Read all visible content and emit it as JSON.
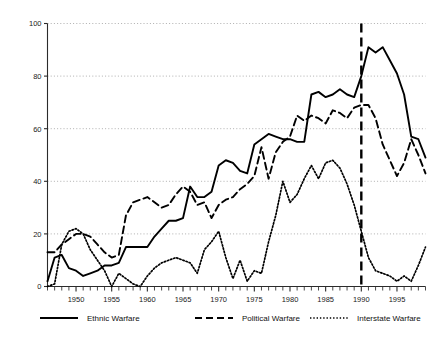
{
  "chart_data": {
    "type": "line",
    "title": "",
    "subtitle": "",
    "xlabel": "",
    "ylabel": "",
    "xlim": [
      1946,
      1999
    ],
    "ylim": [
      0,
      100
    ],
    "grid": true,
    "grid_axis": "y",
    "legend_position": "bottom",
    "x_tick_labels": [
      "1950",
      "1955",
      "1960",
      "1965",
      "1970",
      "1975",
      "1980",
      "1985",
      "1990",
      "1995"
    ],
    "x_tick_values": [
      1950,
      1955,
      1960,
      1965,
      1970,
      1975,
      1980,
      1985,
      1990,
      1995
    ],
    "x_minor_tick_step": 1,
    "y_tick_labels": [
      "0",
      "20",
      "40",
      "60",
      "80",
      "100"
    ],
    "y_tick_values": [
      0,
      20,
      40,
      60,
      80,
      100
    ],
    "annotations": [
      {
        "name": "year-1990-reference-line",
        "type": "vline",
        "x": 1990,
        "style": "dashed",
        "color": "#000000"
      }
    ],
    "x": [
      1946,
      1947,
      1948,
      1949,
      1950,
      1951,
      1952,
      1953,
      1954,
      1955,
      1956,
      1957,
      1958,
      1959,
      1960,
      1961,
      1962,
      1963,
      1964,
      1965,
      1966,
      1967,
      1968,
      1969,
      1970,
      1971,
      1972,
      1973,
      1974,
      1975,
      1976,
      1977,
      1978,
      1979,
      1980,
      1981,
      1982,
      1983,
      1984,
      1985,
      1986,
      1987,
      1988,
      1989,
      1990,
      1991,
      1992,
      1993,
      1994,
      1995,
      1996,
      1997,
      1998,
      1999
    ],
    "series": [
      {
        "name": "Ethnic Warfare",
        "line_style": "solid",
        "color": "#000000",
        "values": [
          2,
          11,
          12,
          7,
          6,
          4,
          5,
          6,
          8,
          8,
          9,
          15,
          15,
          15,
          15,
          19,
          22,
          25,
          25,
          26,
          38,
          34,
          34,
          36,
          46,
          48,
          47,
          44,
          43,
          54,
          56,
          58,
          57,
          56,
          56,
          55,
          55,
          73,
          74,
          72,
          73,
          75,
          73,
          72,
          80,
          91,
          89,
          91,
          86,
          81,
          73,
          57,
          56,
          49
        ]
      },
      {
        "name": "Political Warfare",
        "line_style": "dashed",
        "color": "#000000",
        "values": [
          13,
          13,
          16,
          18,
          20,
          20,
          19,
          16,
          13,
          11,
          12,
          27,
          32,
          33,
          34,
          32,
          30,
          31,
          35,
          38,
          36,
          31,
          32,
          26,
          31,
          33,
          34,
          37,
          39,
          42,
          53,
          41,
          51,
          55,
          57,
          65,
          63,
          65,
          64,
          62,
          67,
          66,
          64,
          68,
          69,
          69,
          64,
          54,
          48,
          42,
          47,
          56,
          50,
          43
        ]
      },
      {
        "name": "Interstate Warfare",
        "line_style": "dotted",
        "color": "#000000",
        "values": [
          0,
          1,
          16,
          21,
          22,
          20,
          14,
          10,
          6,
          0,
          5,
          3,
          1,
          0,
          4,
          7,
          9,
          10,
          11,
          10,
          9,
          5,
          14,
          17,
          21,
          11,
          3,
          10,
          2,
          6,
          5,
          17,
          27,
          40,
          32,
          35,
          41,
          46,
          41,
          47,
          48,
          45,
          39,
          31,
          21,
          11,
          6,
          5,
          4,
          2,
          4,
          2,
          8,
          15
        ]
      }
    ],
    "legend": [
      {
        "label": "Ethnic Warfare",
        "style": "solid"
      },
      {
        "label": "Political Warfare",
        "style": "dashed"
      },
      {
        "label": "Interstate Warfare",
        "style": "dotted"
      }
    ]
  }
}
